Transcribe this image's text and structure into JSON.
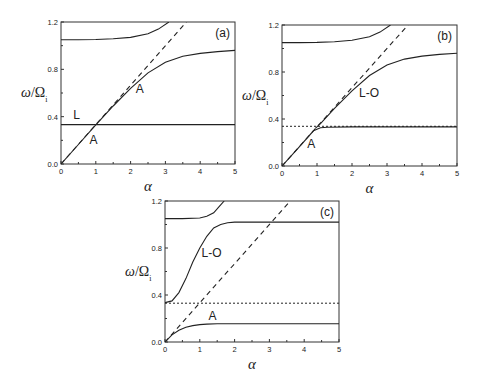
{
  "chart_data": [
    {
      "panel": "(a)",
      "type": "line",
      "xlabel": "α",
      "ylabel": "ω/Ω_i",
      "xlim": [
        0,
        5
      ],
      "ylim": [
        0,
        1.2
      ],
      "xticks": [
        "0",
        "1",
        "2",
        "3",
        "4",
        "5"
      ],
      "yticks": [
        "0.0",
        "0.4",
        "0.8",
        "1.2"
      ],
      "annotations": [
        "L",
        "A",
        "A",
        "(a)"
      ],
      "series": [
        {
          "name": "upper branch",
          "style": "solid",
          "x": [
            0,
            0.5,
            1,
            1.5,
            2,
            2.5,
            2.8,
            3.1
          ],
          "y": [
            1.05,
            1.05,
            1.052,
            1.058,
            1.07,
            1.1,
            1.14,
            1.2
          ]
        },
        {
          "name": "A (acoustic)",
          "style": "solid",
          "x": [
            0,
            0.5,
            1,
            1.5,
            2,
            2.5,
            3,
            3.5,
            4,
            4.5,
            5
          ],
          "y": [
            0,
            0.165,
            0.33,
            0.49,
            0.64,
            0.77,
            0.86,
            0.91,
            0.935,
            0.95,
            0.96
          ]
        },
        {
          "name": "L",
          "style": "solid",
          "x": [
            0,
            5
          ],
          "y": [
            0.333,
            0.333
          ]
        },
        {
          "name": "light line",
          "style": "dashed",
          "x": [
            0,
            3.6
          ],
          "y": [
            0,
            1.2
          ]
        }
      ]
    },
    {
      "panel": "(b)",
      "type": "line",
      "xlabel": "α",
      "ylabel": "ω/Ω_i",
      "xlim": [
        0,
        5
      ],
      "ylim": [
        0,
        1.2
      ],
      "xticks": [
        "0",
        "1",
        "2",
        "3",
        "4",
        "5"
      ],
      "yticks": [
        "0.0",
        "0.4",
        "0.8",
        "1.2"
      ],
      "annotations": [
        "L-O",
        "A",
        "(b)"
      ],
      "series": [
        {
          "name": "upper branch",
          "style": "solid",
          "x": [
            0,
            0.5,
            1,
            1.5,
            2,
            2.5,
            2.8,
            3.1
          ],
          "y": [
            1.05,
            1.05,
            1.052,
            1.058,
            1.07,
            1.1,
            1.14,
            1.2
          ]
        },
        {
          "name": "L-O",
          "style": "solid",
          "x": [
            0.95,
            1.1,
            1.5,
            2,
            2.5,
            3,
            3.5,
            4,
            4.5,
            5
          ],
          "y": [
            0.32,
            0.36,
            0.49,
            0.64,
            0.77,
            0.86,
            0.91,
            0.935,
            0.95,
            0.96
          ]
        },
        {
          "name": "A",
          "style": "solid",
          "x": [
            0,
            0.5,
            0.9,
            1.1,
            1.3,
            2,
            3,
            4,
            5
          ],
          "y": [
            0,
            0.165,
            0.3,
            0.325,
            0.33,
            0.333,
            0.333,
            0.333,
            0.333
          ]
        },
        {
          "name": "ion line",
          "style": "dotted",
          "x": [
            0,
            5
          ],
          "y": [
            0.338,
            0.338
          ]
        },
        {
          "name": "light line",
          "style": "dashed",
          "x": [
            0,
            3.6
          ],
          "y": [
            0,
            1.2
          ]
        }
      ]
    },
    {
      "panel": "(c)",
      "type": "line",
      "xlabel": "α",
      "ylabel": "ω/Ω_i",
      "xlim": [
        0,
        5
      ],
      "ylim": [
        0,
        1.2
      ],
      "xticks": [
        "0",
        "1",
        "2",
        "3",
        "4",
        "5"
      ],
      "yticks": [
        "0.0",
        "0.4",
        "0.8",
        "1.2"
      ],
      "annotations": [
        "L-O",
        "A",
        "(c)"
      ],
      "series": [
        {
          "name": "upper branch",
          "style": "solid",
          "x": [
            0,
            0.5,
            1,
            1.2,
            1.4,
            1.55,
            1.7
          ],
          "y": [
            1.05,
            1.05,
            1.055,
            1.07,
            1.1,
            1.15,
            1.2
          ]
        },
        {
          "name": "L-O",
          "style": "solid",
          "x": [
            0,
            0.2,
            0.4,
            0.6,
            0.8,
            1,
            1.2,
            1.4,
            1.6,
            1.8,
            2,
            2.5,
            3,
            4,
            5
          ],
          "y": [
            0.335,
            0.35,
            0.42,
            0.54,
            0.68,
            0.8,
            0.9,
            0.97,
            1.0,
            1.015,
            1.02,
            1.02,
            1.02,
            1.02,
            1.02
          ]
        },
        {
          "name": "A",
          "style": "solid",
          "x": [
            0,
            0.2,
            0.4,
            0.6,
            0.8,
            1,
            1.2,
            1.5,
            2,
            3,
            4,
            5
          ],
          "y": [
            0,
            0.06,
            0.1,
            0.125,
            0.14,
            0.148,
            0.152,
            0.155,
            0.156,
            0.156,
            0.156,
            0.156
          ]
        },
        {
          "name": "ion line",
          "style": "dotted",
          "x": [
            0,
            5
          ],
          "y": [
            0.33,
            0.33
          ]
        },
        {
          "name": "light line",
          "style": "dashed",
          "x": [
            0,
            3.6
          ],
          "y": [
            0,
            1.2
          ]
        }
      ]
    }
  ],
  "panels": [
    {
      "tag": "(a)",
      "ylabel": "ω/Ω",
      "ysub": "i",
      "xlabel": "α",
      "labels": [
        {
          "t": "L",
          "x": 0.35,
          "y": 0.38
        },
        {
          "t": "A",
          "x": 2.15,
          "y": 0.6
        },
        {
          "t": "A",
          "x": 0.82,
          "y": 0.17
        }
      ]
    },
    {
      "tag": "(b)",
      "ylabel": "ω/Ω",
      "ysub": "i",
      "xlabel": "α",
      "labels": [
        {
          "t": "L-O",
          "x": 2.2,
          "y": 0.59
        },
        {
          "t": "A",
          "x": 0.72,
          "y": 0.15
        }
      ]
    },
    {
      "tag": "(c)",
      "ylabel": "ω/Ω",
      "ysub": "i",
      "xlabel": "α",
      "labels": [
        {
          "t": "L-O",
          "x": 1.05,
          "y": 0.72
        },
        {
          "t": "A",
          "x": 1.25,
          "y": 0.19
        }
      ]
    }
  ]
}
